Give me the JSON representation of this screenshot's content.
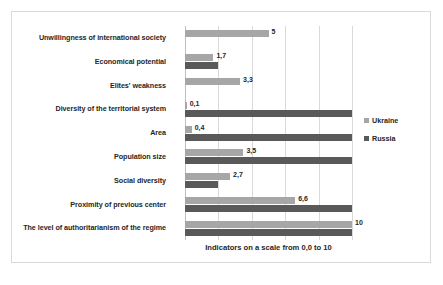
{
  "chart_data": {
    "type": "bar",
    "orientation": "horizontal",
    "title": "",
    "xlabel": "Indicators on a scale from 0,0 to 10",
    "ylabel": "",
    "xlim": [
      0,
      10
    ],
    "xticks": [
      0,
      2,
      4,
      6,
      8,
      10
    ],
    "grid": true,
    "legend_position": "right",
    "categories": [
      "Unwillingness of international society",
      "Economical potential",
      "Elites' weakness",
      "Diversity of the territorial system",
      "Area",
      "Population size",
      "Social diversity",
      "Proximity of previous center",
      "The level of authoritarianism of the regime"
    ],
    "series": [
      {
        "name": "Ukraine",
        "color": "#a6a6a6",
        "values": [
          5,
          1.7,
          3.3,
          0.1,
          0.4,
          3.5,
          2.7,
          6.6,
          10
        ],
        "labels": [
          "5",
          "1,7",
          "3,3",
          "0,1",
          "0,4",
          "3,5",
          "2,7",
          "6,6",
          "10"
        ]
      },
      {
        "name": "Russia",
        "color": "#595959",
        "values": [
          0,
          2.0,
          0,
          10,
          10,
          10,
          2.0,
          10,
          10
        ],
        "labels": [
          "",
          "",
          "",
          "",
          "",
          "",
          "",
          "",
          ""
        ]
      }
    ]
  },
  "legend": {
    "items": [
      {
        "label": "Ukraine",
        "color": "#a6a6a6"
      },
      {
        "label": "Russia",
        "color": "#595959"
      }
    ]
  },
  "axis": {
    "x_title": "Indicators on a scale from 0,0 to 10"
  },
  "colors": {
    "ukraine": "#a6a6a6",
    "russia": "#595959",
    "gridline": "#d9d9d9",
    "frame_border": "#d9d9d9",
    "text": "#262626"
  }
}
